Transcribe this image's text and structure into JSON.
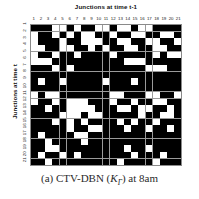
{
  "figure": {
    "top_title": "Junctions at time t-1",
    "y_label": "Junctions at time t",
    "caption_prefix": "(a) CTV-DBN (",
    "caption_symbol": "K",
    "caption_subscript": "Γ",
    "caption_suffix": ") at 8am"
  },
  "chart_data": {
    "type": "heatmap",
    "title": "Junctions at time t-1",
    "xlabel": "Junctions at time t-1",
    "ylabel": "Junctions at time t",
    "caption": "(a) CTV-DBN (KΓ) at 8am",
    "grid": true,
    "legend": null,
    "colors": {
      "on": "#000000",
      "off": "#ffffff",
      "gridline": "#9a9a9a"
    },
    "value_meaning": {
      "1": "edge present (black)",
      "0": "no edge (white)"
    },
    "x": [
      1,
      2,
      3,
      4,
      5,
      6,
      7,
      8,
      9,
      10,
      11,
      12,
      13,
      14,
      15,
      16,
      17,
      18,
      19,
      20,
      21
    ],
    "y": [
      1,
      2,
      3,
      4,
      5,
      6,
      7,
      8,
      9,
      10,
      11,
      12,
      13,
      14,
      15,
      16,
      17,
      18,
      19,
      20,
      21
    ],
    "xlim": [
      1,
      21
    ],
    "ylim": [
      1,
      21
    ],
    "rows": 21,
    "cols": 21,
    "values": [
      [
        1,
        1,
        1,
        0,
        0,
        1,
        0,
        1,
        1,
        0,
        0,
        1,
        0,
        0,
        1,
        0,
        0,
        1,
        1,
        1,
        1
      ],
      [
        0,
        1,
        1,
        0,
        1,
        0,
        1,
        0,
        0,
        1,
        1,
        0,
        1,
        1,
        0,
        0,
        1,
        1,
        0,
        0,
        1
      ],
      [
        0,
        1,
        1,
        1,
        0,
        1,
        1,
        0,
        0,
        0,
        1,
        1,
        0,
        0,
        1,
        1,
        0,
        0,
        1,
        1,
        0
      ],
      [
        0,
        0,
        1,
        1,
        0,
        0,
        1,
        1,
        0,
        1,
        0,
        1,
        1,
        0,
        0,
        1,
        1,
        0,
        0,
        1,
        1
      ],
      [
        0,
        1,
        1,
        0,
        1,
        1,
        0,
        1,
        1,
        1,
        1,
        0,
        1,
        1,
        1,
        1,
        1,
        0,
        1,
        0,
        0
      ],
      [
        0,
        0,
        0,
        1,
        1,
        1,
        1,
        1,
        1,
        1,
        1,
        1,
        1,
        0,
        0,
        0,
        1,
        1,
        1,
        1,
        1
      ],
      [
        1,
        1,
        1,
        0,
        1,
        0,
        1,
        1,
        1,
        1,
        1,
        1,
        1,
        1,
        1,
        1,
        0,
        0,
        0,
        1,
        1
      ],
      [
        1,
        1,
        1,
        1,
        1,
        1,
        1,
        1,
        1,
        1,
        1,
        1,
        1,
        1,
        1,
        1,
        1,
        1,
        1,
        1,
        1
      ],
      [
        1,
        0,
        1,
        1,
        0,
        1,
        1,
        1,
        1,
        1,
        0,
        1,
        1,
        1,
        0,
        1,
        1,
        1,
        1,
        1,
        1
      ],
      [
        1,
        1,
        1,
        1,
        1,
        1,
        1,
        1,
        1,
        1,
        1,
        1,
        1,
        1,
        1,
        1,
        1,
        1,
        1,
        1,
        1
      ],
      [
        0,
        1,
        0,
        0,
        1,
        1,
        1,
        1,
        1,
        1,
        1,
        0,
        0,
        1,
        1,
        1,
        0,
        0,
        1,
        1,
        0
      ],
      [
        0,
        1,
        1,
        0,
        1,
        0,
        0,
        0,
        1,
        1,
        1,
        0,
        1,
        1,
        0,
        1,
        1,
        0,
        0,
        1,
        1
      ],
      [
        1,
        1,
        0,
        1,
        1,
        0,
        0,
        0,
        0,
        1,
        1,
        1,
        0,
        0,
        1,
        0,
        0,
        1,
        1,
        0,
        1
      ],
      [
        1,
        1,
        1,
        1,
        0,
        0,
        0,
        1,
        0,
        0,
        1,
        1,
        1,
        1,
        1,
        0,
        1,
        1,
        0,
        0,
        1
      ],
      [
        1,
        1,
        1,
        0,
        1,
        0,
        1,
        0,
        1,
        1,
        1,
        1,
        0,
        1,
        0,
        1,
        1,
        0,
        1,
        1,
        1
      ],
      [
        1,
        1,
        1,
        1,
        1,
        0,
        1,
        1,
        0,
        0,
        1,
        1,
        1,
        0,
        1,
        1,
        0,
        1,
        1,
        0,
        1
      ],
      [
        1,
        0,
        1,
        1,
        1,
        1,
        0,
        0,
        1,
        1,
        1,
        1,
        1,
        1,
        1,
        1,
        1,
        1,
        1,
        1,
        1
      ],
      [
        1,
        1,
        0,
        1,
        1,
        1,
        1,
        0,
        1,
        1,
        1,
        1,
        1,
        1,
        1,
        1,
        1,
        1,
        1,
        1,
        1
      ],
      [
        1,
        1,
        0,
        0,
        1,
        1,
        1,
        1,
        1,
        1,
        1,
        1,
        1,
        0,
        1,
        1,
        0,
        1,
        1,
        1,
        1
      ],
      [
        1,
        0,
        1,
        1,
        0,
        1,
        0,
        1,
        1,
        1,
        1,
        1,
        1,
        1,
        0,
        1,
        1,
        1,
        0,
        1,
        1
      ],
      [
        1,
        1,
        0,
        1,
        1,
        1,
        1,
        1,
        1,
        1,
        1,
        1,
        0,
        1,
        1,
        1,
        1,
        0,
        1,
        1,
        1
      ]
    ]
  }
}
